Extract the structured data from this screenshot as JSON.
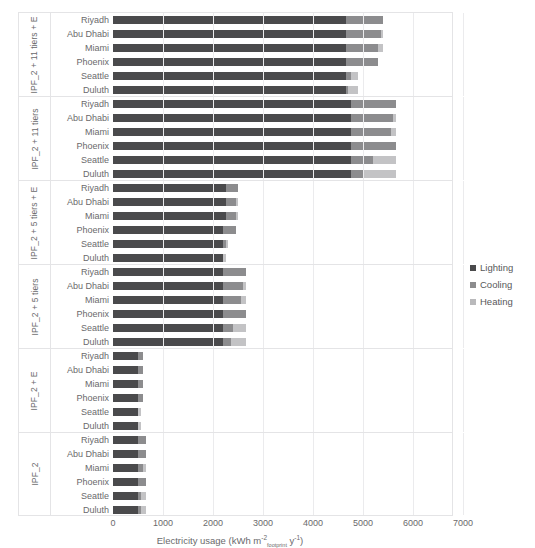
{
  "page_header": {
    "left": "",
    "right": ""
  },
  "legend": {
    "position": "right",
    "items": [
      {
        "label": "Lighting",
        "color": "#4a4a4c",
        "icon": "square-swatch-icon"
      },
      {
        "label": "Cooling",
        "color": "#8c8c8e",
        "icon": "square-swatch-icon"
      },
      {
        "label": "Heating",
        "color": "#b9b9bb",
        "icon": "square-swatch-icon"
      }
    ]
  },
  "axis": {
    "x_title_main": "Electricity usage (kWh m",
    "x_title_sup1": "-2",
    "x_title_sub1": "footprint",
    "x_title_mid": " y",
    "x_title_sup2": "-1",
    "x_title_end": ")",
    "x_ticks": [
      "0",
      "1000",
      "2000",
      "3000",
      "4000",
      "5000",
      "6000",
      "7000"
    ]
  },
  "chart_data": {
    "type": "bar",
    "orientation": "horizontal",
    "stacked": true,
    "title": "",
    "xlabel": "Electricity usage (kWh m-2footprint y-1)",
    "ylabel": "",
    "xlim": [
      0,
      7000
    ],
    "xticks": [
      0,
      1000,
      2000,
      3000,
      4000,
      5000,
      6000,
      7000
    ],
    "grid": true,
    "legend_position": "right",
    "series": [
      {
        "name": "Lighting",
        "color": "#4a4a4c"
      },
      {
        "name": "Cooling",
        "color": "#8c8c8e"
      },
      {
        "name": "Heating",
        "color": "#c3c3c5"
      }
    ],
    "cities": [
      "Riyadh",
      "Abu Dhabi",
      "Miami",
      "Phoenix",
      "Seattle",
      "Duluth"
    ],
    "groups": [
      {
        "label": "IPF_2 + 11 tiers + E",
        "rows": [
          {
            "city": "Riyadh",
            "Lighting": 4650,
            "Cooling": 750,
            "Heating": 0,
            "total": 5400
          },
          {
            "city": "Abu Dhabi",
            "Lighting": 4650,
            "Cooling": 700,
            "Heating": 50,
            "total": 5400
          },
          {
            "city": "Miami",
            "Lighting": 4650,
            "Cooling": 650,
            "Heating": 100,
            "total": 5400
          },
          {
            "city": "Phoenix",
            "Lighting": 4650,
            "Cooling": 650,
            "Heating": 0,
            "total": 5300
          },
          {
            "city": "Seattle",
            "Lighting": 4650,
            "Cooling": 100,
            "Heating": 150,
            "total": 4900
          },
          {
            "city": "Duluth",
            "Lighting": 4650,
            "Cooling": 50,
            "Heating": 200,
            "total": 4900
          }
        ]
      },
      {
        "label": "IPF_2 + 11 tiers",
        "rows": [
          {
            "city": "Riyadh",
            "Lighting": 4750,
            "Cooling": 900,
            "Heating": 0,
            "total": 5650
          },
          {
            "city": "Abu Dhabi",
            "Lighting": 4750,
            "Cooling": 850,
            "Heating": 50,
            "total": 5650
          },
          {
            "city": "Miami",
            "Lighting": 4750,
            "Cooling": 800,
            "Heating": 100,
            "total": 5650
          },
          {
            "city": "Phoenix",
            "Lighting": 4750,
            "Cooling": 900,
            "Heating": 0,
            "total": 5650
          },
          {
            "city": "Seattle",
            "Lighting": 4750,
            "Cooling": 450,
            "Heating": 450,
            "total": 5650
          },
          {
            "city": "Duluth",
            "Lighting": 4750,
            "Cooling": 250,
            "Heating": 650,
            "total": 5650
          }
        ]
      },
      {
        "label": "IPF_2 + 5 tiers + E",
        "rows": [
          {
            "city": "Riyadh",
            "Lighting": 2250,
            "Cooling": 250,
            "Heating": 0,
            "total": 2500
          },
          {
            "city": "Abu Dhabi",
            "Lighting": 2250,
            "Cooling": 200,
            "Heating": 50,
            "total": 2500
          },
          {
            "city": "Miami",
            "Lighting": 2250,
            "Cooling": 200,
            "Heating": 50,
            "total": 2500
          },
          {
            "city": "Phoenix",
            "Lighting": 2200,
            "Cooling": 250,
            "Heating": 0,
            "total": 2450
          },
          {
            "city": "Seattle",
            "Lighting": 2200,
            "Cooling": 50,
            "Heating": 50,
            "total": 2300
          },
          {
            "city": "Duluth",
            "Lighting": 2200,
            "Cooling": 0,
            "Heating": 50,
            "total": 2250
          }
        ]
      },
      {
        "label": "IPF_2 + 5 tiers",
        "rows": [
          {
            "city": "Riyadh",
            "Lighting": 2200,
            "Cooling": 450,
            "Heating": 0,
            "total": 2650
          },
          {
            "city": "Abu Dhabi",
            "Lighting": 2200,
            "Cooling": 400,
            "Heating": 50,
            "total": 2650
          },
          {
            "city": "Miami",
            "Lighting": 2200,
            "Cooling": 350,
            "Heating": 100,
            "total": 2650
          },
          {
            "city": "Phoenix",
            "Lighting": 2200,
            "Cooling": 450,
            "Heating": 0,
            "total": 2650
          },
          {
            "city": "Seattle",
            "Lighting": 2200,
            "Cooling": 200,
            "Heating": 250,
            "total": 2650
          },
          {
            "city": "Duluth",
            "Lighting": 2200,
            "Cooling": 150,
            "Heating": 300,
            "total": 2650
          }
        ]
      },
      {
        "label": "IPF_2 + E",
        "rows": [
          {
            "city": "Riyadh",
            "Lighting": 500,
            "Cooling": 100,
            "Heating": 0,
            "total": 600
          },
          {
            "city": "Abu Dhabi",
            "Lighting": 500,
            "Cooling": 100,
            "Heating": 0,
            "total": 600
          },
          {
            "city": "Miami",
            "Lighting": 500,
            "Cooling": 100,
            "Heating": 0,
            "total": 600
          },
          {
            "city": "Phoenix",
            "Lighting": 500,
            "Cooling": 100,
            "Heating": 0,
            "total": 600
          },
          {
            "city": "Seattle",
            "Lighting": 500,
            "Cooling": 0,
            "Heating": 50,
            "total": 550
          },
          {
            "city": "Duluth",
            "Lighting": 500,
            "Cooling": 0,
            "Heating": 50,
            "total": 550
          }
        ]
      },
      {
        "label": "IPF_2",
        "rows": [
          {
            "city": "Riyadh",
            "Lighting": 500,
            "Cooling": 150,
            "Heating": 0,
            "total": 650
          },
          {
            "city": "Abu Dhabi",
            "Lighting": 500,
            "Cooling": 150,
            "Heating": 0,
            "total": 650
          },
          {
            "city": "Miami",
            "Lighting": 500,
            "Cooling": 100,
            "Heating": 50,
            "total": 650
          },
          {
            "city": "Phoenix",
            "Lighting": 500,
            "Cooling": 150,
            "Heating": 0,
            "total": 650
          },
          {
            "city": "Seattle",
            "Lighting": 500,
            "Cooling": 50,
            "Heating": 100,
            "total": 650
          },
          {
            "city": "Duluth",
            "Lighting": 500,
            "Cooling": 50,
            "Heating": 100,
            "total": 650
          }
        ]
      }
    ]
  }
}
